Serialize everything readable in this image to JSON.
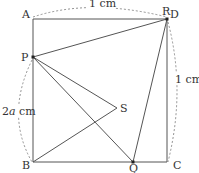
{
  "diagram": {
    "points": {
      "A": "A",
      "B": "B",
      "C": "C",
      "D": "D",
      "P": "P",
      "Q": "Q",
      "R": "R",
      "S": "S"
    },
    "dimensions": {
      "top": "1 cm",
      "right": "1 cm",
      "left_prefix": "2",
      "left_var": "a",
      "left_suffix": " cm"
    }
  }
}
